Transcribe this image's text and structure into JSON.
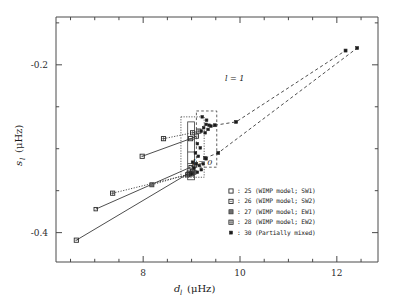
{
  "figure": {
    "background_color": "#ffffff",
    "foreground_color": "#1a1a1a"
  },
  "axes": {
    "x_title_main": "d",
    "x_title_sub": "l",
    "x_title_unit": "(μHz)",
    "y_title_main": "s",
    "y_title_sub": "l",
    "y_title_unit": "(μHz)",
    "x_ticklabels": [
      "8",
      "10",
      "12"
    ],
    "y_ticklabels": [
      "-0.2",
      "-0.4"
    ]
  },
  "annotations": {
    "l_eq_1": "l = 1",
    "l_eq_0": "l = 0"
  },
  "legend": {
    "entries": [
      {
        "marker": "open-square-small",
        "label": ": 25 (WIMP model; SW1)"
      },
      {
        "marker": "dotted-square",
        "label": ": 26 (WIMP model; SW2)"
      },
      {
        "marker": "grey-square",
        "label": ": 27 (WIMP model; EW1)"
      },
      {
        "marker": "crossed-square",
        "label": ": 28 (WIMP model; EW2)"
      },
      {
        "marker": "filled-square",
        "label": ": 30 (Partially mixed)"
      }
    ]
  },
  "chart_data": {
    "type": "scatter",
    "title": "",
    "xlabel": "d_l (μHz)",
    "ylabel": "s_l (μHz)",
    "xlim": [
      6.2,
      12.85
    ],
    "ylim": [
      -0.435,
      -0.143
    ],
    "xticks": [
      8,
      10,
      12
    ],
    "yticks": [
      -0.2,
      -0.4
    ],
    "xminor_step": 0.5,
    "yminor_step": 0.05,
    "grid": false,
    "legend_position": "lower-right-inside",
    "series": [
      {
        "name": "25 (WIMP model; SW1)",
        "marker": "open-square-small",
        "linestyle": "solid",
        "points": [
          [
            7.02,
            -0.372
          ],
          [
            8.98,
            -0.322
          ],
          [
            9.06,
            -0.32
          ]
        ]
      },
      {
        "name": "26 (WIMP model; SW2)",
        "marker": "dotted-square",
        "linestyle": "solid",
        "points": [
          [
            6.62,
            -0.409
          ],
          [
            8.95,
            -0.329
          ],
          [
            9.02,
            -0.327
          ]
        ]
      },
      {
        "name": "26b (WIMP model; SW2) upper",
        "marker": "dotted-square",
        "linestyle": "solid",
        "points": [
          [
            7.98,
            -0.309
          ],
          [
            8.98,
            -0.288
          ],
          [
            9.1,
            -0.285
          ]
        ]
      },
      {
        "name": "27 (WIMP model; EW1)",
        "marker": "grey-square",
        "linestyle": "dotted",
        "points": [
          [
            8.18,
            -0.343
          ],
          [
            8.95,
            -0.33
          ],
          [
            9.05,
            -0.328
          ]
        ]
      },
      {
        "name": "28 (WIMP model; EW2)",
        "marker": "crossed-square",
        "linestyle": "dotted",
        "points": [
          [
            7.37,
            -0.353
          ],
          [
            8.92,
            -0.331
          ],
          [
            9.0,
            -0.33
          ]
        ]
      },
      {
        "name": "28b (WIMP model; EW2) upper",
        "marker": "crossed-square",
        "linestyle": "dotted",
        "points": [
          [
            8.42,
            -0.288
          ],
          [
            9.02,
            -0.281
          ],
          [
            9.15,
            -0.279
          ]
        ]
      },
      {
        "name": "30 (Partially mixed) l=1 branch",
        "marker": "filled-square",
        "linestyle": "dashed",
        "points": [
          [
            9.48,
            -0.272
          ],
          [
            9.92,
            -0.268
          ],
          [
            12.18,
            -0.183
          ]
        ]
      },
      {
        "name": "30 (Partially mixed) l=0 branch",
        "marker": "filled-square",
        "linestyle": "dashed",
        "points": [
          [
            9.28,
            -0.311
          ],
          [
            9.55,
            -0.305
          ],
          [
            12.42,
            -0.18
          ]
        ]
      }
    ],
    "cluster_points": [
      [
        9.22,
        -0.262
      ],
      [
        9.31,
        -0.266
      ],
      [
        9.3,
        -0.271
      ],
      [
        9.36,
        -0.272
      ],
      [
        9.25,
        -0.275
      ],
      [
        9.34,
        -0.277
      ],
      [
        9.4,
        -0.273
      ],
      [
        9.2,
        -0.279
      ],
      [
        9.28,
        -0.281
      ],
      [
        9.12,
        -0.294
      ],
      [
        9.18,
        -0.299
      ],
      [
        9.08,
        -0.305
      ],
      [
        9.14,
        -0.309
      ],
      [
        9.02,
        -0.316
      ],
      [
        9.1,
        -0.318
      ],
      [
        9.16,
        -0.32
      ],
      [
        9.05,
        -0.323
      ],
      [
        9.2,
        -0.325
      ],
      [
        9.12,
        -0.328
      ],
      [
        9.0,
        -0.33
      ],
      [
        9.24,
        -0.318
      ],
      [
        9.3,
        -0.312
      ]
    ],
    "boxes": [
      {
        "name": "l1-dashed-box",
        "style": "dashed",
        "x0": 9.1,
        "x1": 9.52,
        "y0": -0.322,
        "y1": -0.255
      },
      {
        "name": "l0-dotted-box",
        "style": "dotted",
        "x0": 8.78,
        "x1": 9.26,
        "y0": -0.334,
        "y1": -0.262
      },
      {
        "name": "inner-solid-box",
        "style": "solid",
        "x0": 8.92,
        "x1": 9.06,
        "y0": -0.337,
        "y1": -0.268
      }
    ]
  }
}
